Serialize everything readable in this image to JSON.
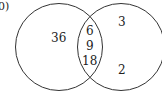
{
  "diagram": {
    "type": "venn",
    "label": "0)",
    "left_only": "36",
    "intersection": [
      "6",
      "9",
      "18"
    ],
    "right_only": [
      "3",
      "2"
    ],
    "stroke_color": "#333333"
  }
}
